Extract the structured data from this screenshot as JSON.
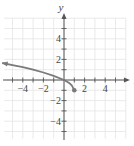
{
  "chart_data": {
    "type": "line",
    "title": "",
    "xlabel": "x",
    "ylabel": "y",
    "xlim": [
      -6,
      6
    ],
    "ylim": [
      -6,
      6
    ],
    "grid": true,
    "x_ticks": [
      -4,
      -2,
      2,
      4
    ],
    "y_ticks": [
      4,
      2,
      -2,
      -4
    ],
    "x_tick_labels": [
      "−4",
      "−2",
      "2",
      "4"
    ],
    "y_tick_labels": [
      "4",
      "2",
      "−2",
      "−4"
    ],
    "series": [
      {
        "name": "f(x)",
        "points": [
          [
            -6,
            1.65
          ],
          [
            -5,
            1.45
          ],
          [
            -4,
            1.24
          ],
          [
            -3,
            1.0
          ],
          [
            -2,
            0.73
          ],
          [
            -1,
            0.41
          ],
          [
            0,
            0
          ],
          [
            0.5,
            -0.29
          ],
          [
            0.75,
            -0.5
          ],
          [
            1,
            -1
          ]
        ],
        "endpoint": {
          "x": 1,
          "y": -1,
          "style": "closed-dot"
        },
        "arrow_left": true
      }
    ],
    "colors": {
      "curve": "#7a7a7a",
      "grid": "#e4e4e4",
      "axis": "#555555"
    }
  }
}
